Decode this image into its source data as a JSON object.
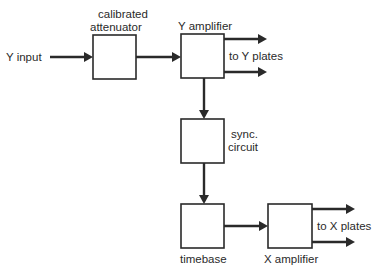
{
  "diagram": {
    "type": "block-diagram",
    "inputs": {
      "y_input": "Y input"
    },
    "blocks": {
      "attenuator": {
        "label_line1": "calibrated",
        "label_line2": "attenuator"
      },
      "y_amplifier": {
        "label": "Y amplifier"
      },
      "sync": {
        "label_line1": "sync.",
        "label_line2": "circuit"
      },
      "timebase": {
        "label": "timebase"
      },
      "x_amplifier": {
        "label": "X amplifier"
      }
    },
    "outputs": {
      "y_plates": "to Y plates",
      "x_plates": "to X plates"
    },
    "connections": [
      {
        "from": "Y input",
        "to": "calibrated attenuator"
      },
      {
        "from": "calibrated attenuator",
        "to": "Y amplifier"
      },
      {
        "from": "Y amplifier",
        "to": "to Y plates (upper)"
      },
      {
        "from": "Y amplifier",
        "to": "to Y plates (lower)"
      },
      {
        "from": "Y amplifier",
        "to": "sync. circuit"
      },
      {
        "from": "sync. circuit",
        "to": "timebase"
      },
      {
        "from": "timebase",
        "to": "X amplifier"
      },
      {
        "from": "X amplifier",
        "to": "to X plates (upper)"
      },
      {
        "from": "X amplifier",
        "to": "to X plates (lower)"
      }
    ],
    "colors": {
      "ink": "#2a2a2a",
      "background": "#ffffff"
    }
  }
}
